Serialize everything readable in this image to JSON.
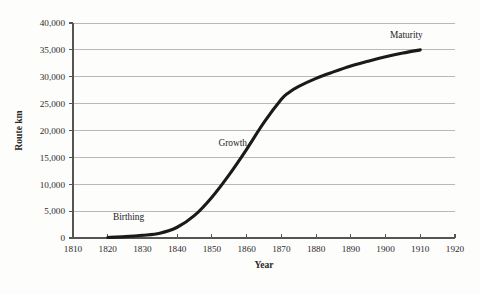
{
  "chart_data": {
    "type": "line",
    "title": "",
    "subtitle": "",
    "xlabel": "Year",
    "ylabel": "Route km",
    "xlim": [
      1810,
      1920
    ],
    "ylim": [
      0,
      40000
    ],
    "grid": true,
    "grid_axis": "y",
    "legend": "none",
    "x_ticks": [
      1810,
      1820,
      1830,
      1840,
      1850,
      1860,
      1870,
      1880,
      1890,
      1900,
      1910,
      1920
    ],
    "x_tick_labels": [
      "1810",
      "1820",
      "1830",
      "1840",
      "1850",
      "1860",
      "1870",
      "1880",
      "1890",
      "1900",
      "1910",
      "1920"
    ],
    "y_ticks": [
      0,
      5000,
      10000,
      15000,
      20000,
      25000,
      30000,
      35000,
      40000
    ],
    "y_tick_labels": [
      "0",
      "5,000",
      "10,000",
      "15,000",
      "20,000",
      "25,000",
      "30,000",
      "35,000",
      "40,000"
    ],
    "series": [
      {
        "name": "Route km",
        "color": "#1a1a1a",
        "x": [
          1820,
          1825,
          1830,
          1835,
          1840,
          1845,
          1850,
          1855,
          1860,
          1865,
          1870,
          1872,
          1875,
          1880,
          1885,
          1890,
          1895,
          1900,
          1905,
          1910
        ],
        "values": [
          100,
          250,
          500,
          900,
          2000,
          4200,
          7600,
          11800,
          16500,
          21500,
          25800,
          27000,
          28200,
          29700,
          30900,
          32000,
          32900,
          33700,
          34400,
          35000
        ]
      }
    ],
    "annotations": [
      {
        "id": "birthing",
        "label": "Birthing",
        "x": 1826,
        "y": 3300
      },
      {
        "id": "growth",
        "label": "Growth",
        "x": 1856,
        "y": 17200
      },
      {
        "id": "maturity",
        "label": "Maturity",
        "x": 1906,
        "y": 37300
      }
    ]
  },
  "colors": {
    "curve": "#1a1a1a",
    "gridline": "#b9b9b9",
    "axis": "#555555",
    "text": "#2b2b2b",
    "background": "#fdfdfc"
  }
}
